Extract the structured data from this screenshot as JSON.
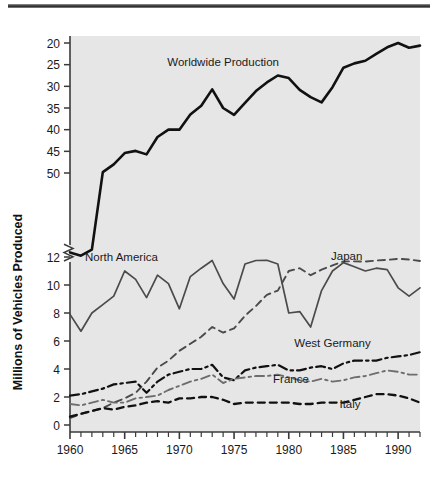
{
  "figure": {
    "background": "#ffffff",
    "plot_background": "#e6e6e6",
    "axis_color": "#3a3a3a",
    "rule_color": "#3a3a3a"
  },
  "chart_data": {
    "type": "line",
    "title": "",
    "xlabel": "",
    "ylabel": "Millions of Vehicles Produced",
    "grid": false,
    "legend": "inline-labels",
    "xlim": [
      1960,
      1992
    ],
    "x_ticks_major": [
      1960,
      1965,
      1970,
      1975,
      1980,
      1985,
      1990
    ],
    "x_ticks_minor_every": 1,
    "y_axis_break": {
      "between": [
        12,
        20
      ],
      "symbol": "zigzag"
    },
    "y_ticks_lower": [
      0,
      2,
      4,
      6,
      8,
      10,
      12
    ],
    "y_ticks_upper": [
      20,
      25,
      30,
      35,
      40,
      45,
      50
    ],
    "ylim_lower": [
      0,
      12
    ],
    "ylim_upper": [
      20,
      50
    ],
    "x": [
      1960,
      1961,
      1962,
      1963,
      1964,
      1965,
      1966,
      1967,
      1968,
      1969,
      1970,
      1971,
      1972,
      1973,
      1974,
      1975,
      1976,
      1977,
      1978,
      1979,
      1980,
      1981,
      1982,
      1983,
      1984,
      1985,
      1986,
      1987,
      1988,
      1989,
      1990,
      1991,
      1992
    ],
    "series": [
      {
        "name": "Worldwide Production",
        "label": "Worldwide Production",
        "style": "solid",
        "color": "#111111",
        "width": 2.6,
        "label_xy": [
          1974.0,
          44.6
        ],
        "values": [
          16.5,
          15.0,
          17.8,
          20.2,
          22.0,
          24.6,
          25.1,
          24.3,
          28.3,
          30.0,
          30.0,
          33.5,
          35.5,
          39.3,
          35.0,
          33.4,
          36.2,
          38.9,
          40.9,
          42.5,
          41.9,
          39.2,
          37.5,
          36.3,
          39.8,
          44.3,
          45.3,
          45.9,
          47.5,
          49.0,
          50.0,
          48.9,
          49.4
        ]
      },
      {
        "name": "North America",
        "label": "North America",
        "style": "solid",
        "color": "#4b4b4b",
        "width": 1.7,
        "label_xy": [
          1964.7,
          12.4
        ],
        "values": [
          7.9,
          6.7,
          8.0,
          8.6,
          9.2,
          11.0,
          10.4,
          9.1,
          10.7,
          10.1,
          8.3,
          10.6,
          11.2,
          12.7,
          10.1,
          9.0,
          11.5,
          12.7,
          12.8,
          11.5,
          8.0,
          8.1,
          7.0,
          9.6,
          11.0,
          11.6,
          11.3,
          11.0,
          11.2,
          11.1,
          9.8,
          9.2,
          9.8
        ]
      },
      {
        "name": "Japan",
        "label": "Japan",
        "style": "dashed",
        "color": "#4b4b4b",
        "width": 1.9,
        "label_xy": [
          1985.3,
          13.0
        ],
        "values": [
          0.5,
          0.8,
          1.0,
          1.2,
          1.6,
          1.9,
          2.3,
          3.1,
          4.1,
          4.6,
          5.3,
          5.8,
          6.3,
          7.0,
          6.6,
          6.9,
          7.8,
          8.5,
          9.3,
          9.6,
          11.0,
          11.2,
          10.7,
          11.1,
          11.4,
          12.3,
          12.3,
          12.2,
          12.7,
          13.0,
          13.5,
          13.2,
          12.5
        ]
      },
      {
        "name": "West Germany",
        "label": "West Germany",
        "style": "dashdot",
        "color": "#111111",
        "width": 2.2,
        "label_xy": [
          1984.0,
          5.6
        ],
        "values": [
          2.1,
          2.2,
          2.4,
          2.6,
          2.9,
          3.0,
          3.1,
          2.3,
          3.1,
          3.6,
          3.8,
          4.0,
          4.0,
          4.3,
          3.4,
          3.2,
          3.9,
          4.1,
          4.2,
          4.3,
          3.9,
          3.9,
          4.1,
          4.2,
          4.0,
          4.4,
          4.6,
          4.6,
          4.6,
          4.8,
          4.9,
          5.0,
          5.2
        ]
      },
      {
        "name": "France",
        "label": "France",
        "style": "dashdot",
        "color": "#6d6d6d",
        "width": 1.9,
        "label_xy": [
          1980.2,
          3.0
        ],
        "values": [
          1.5,
          1.4,
          1.6,
          1.8,
          1.6,
          1.6,
          1.9,
          2.0,
          2.1,
          2.5,
          2.8,
          3.1,
          3.3,
          3.6,
          3.0,
          3.3,
          3.4,
          3.5,
          3.5,
          3.6,
          3.4,
          3.2,
          3.1,
          3.3,
          3.1,
          3.2,
          3.4,
          3.5,
          3.7,
          3.9,
          3.8,
          3.6,
          3.6
        ]
      },
      {
        "name": "Italy",
        "label": "Italy",
        "style": "dashed",
        "color": "#111111",
        "width": 2.3,
        "label_xy": [
          1985.6,
          1.25
        ],
        "values": [
          0.6,
          0.8,
          1.0,
          1.2,
          1.1,
          1.3,
          1.4,
          1.6,
          1.7,
          1.6,
          1.9,
          1.9,
          2.0,
          2.0,
          1.8,
          1.5,
          1.6,
          1.6,
          1.6,
          1.6,
          1.6,
          1.5,
          1.5,
          1.6,
          1.6,
          1.6,
          1.8,
          2.0,
          2.2,
          2.2,
          2.1,
          1.9,
          1.6
        ]
      }
    ]
  },
  "axis_labels": {
    "y_title": "Millions of Vehicles Produced",
    "x_tick_labels": [
      "1960",
      "1965",
      "1970",
      "1975",
      "1980",
      "1985",
      "1990"
    ],
    "y_tick_labels_upper": [
      "50",
      "45",
      "40",
      "35",
      "30",
      "25",
      "20"
    ],
    "y_tick_labels_lower": [
      "12",
      "10",
      "8",
      "6",
      "4",
      "2",
      "0"
    ]
  }
}
